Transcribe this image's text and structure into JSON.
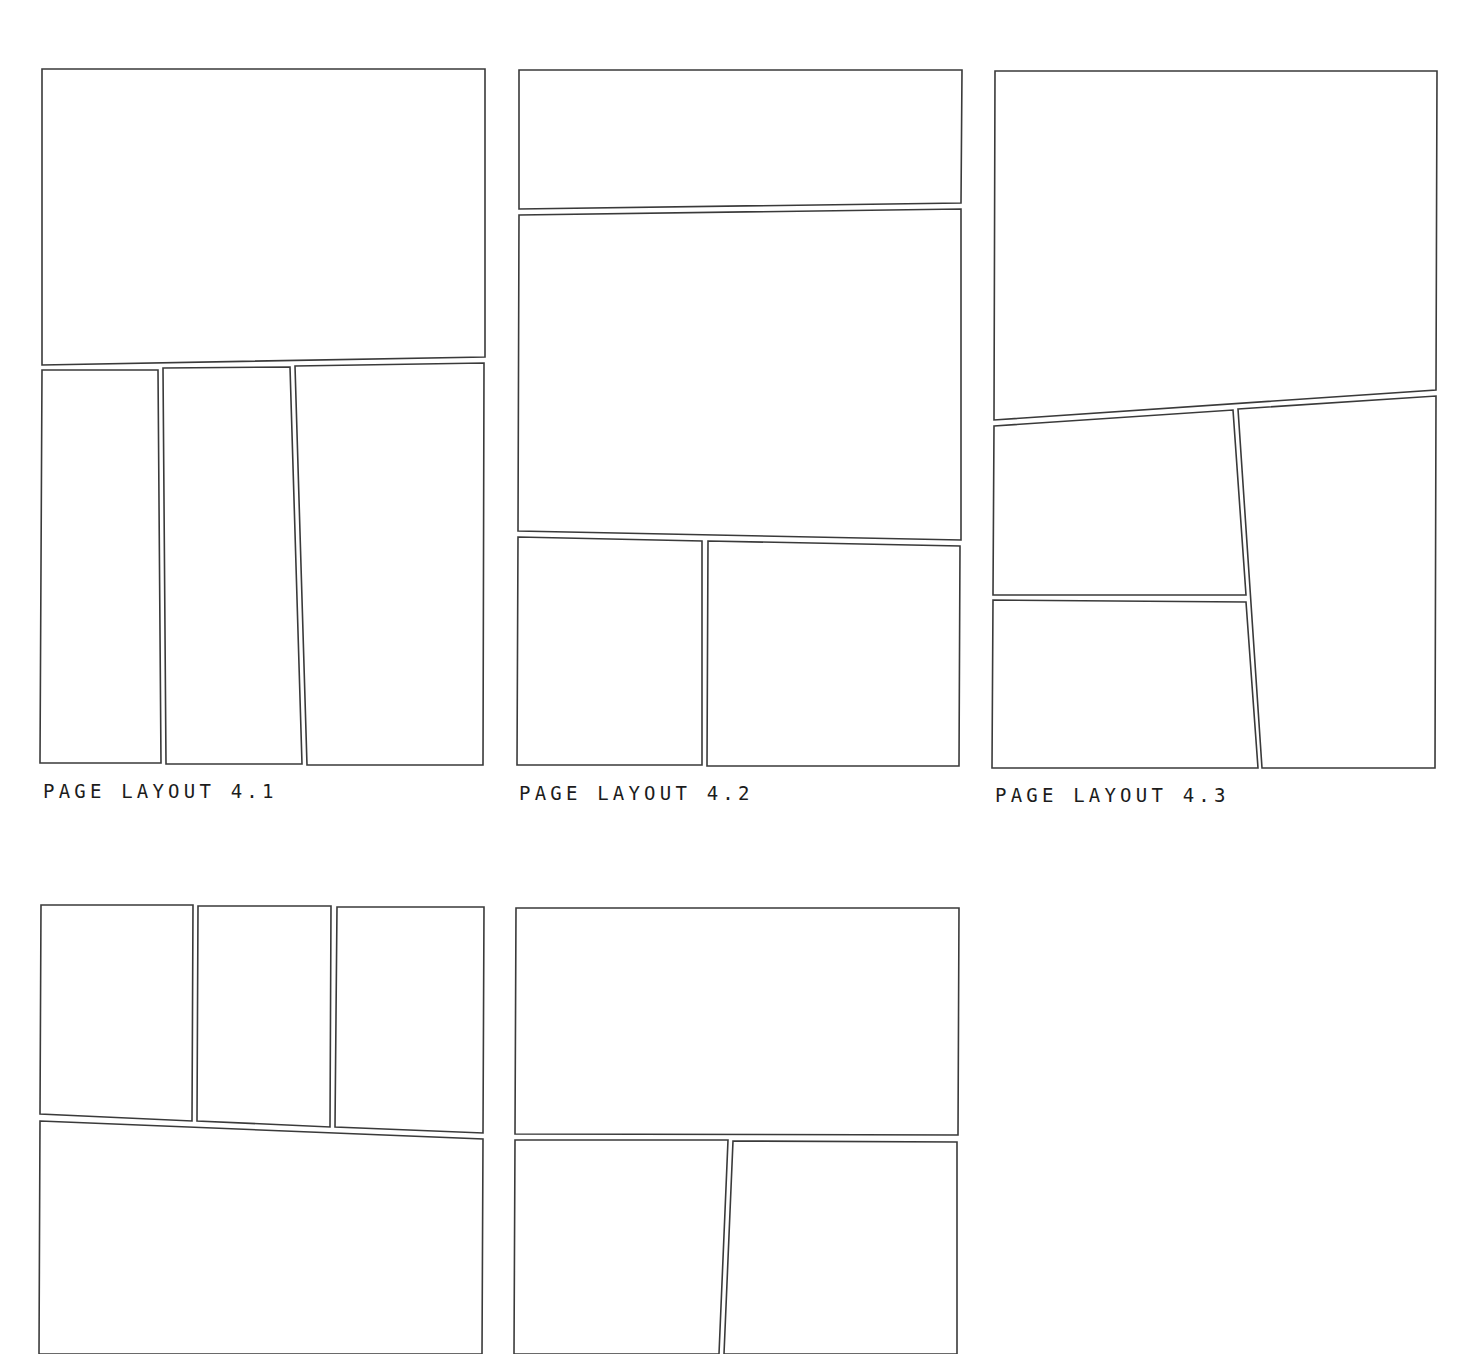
{
  "layouts": [
    {
      "id": "4.1",
      "caption": "PAGE LAYOUT 4.1",
      "caption_pos": [
        43,
        780
      ],
      "panels": [
        [
          [
            42,
            69
          ],
          [
            485,
            69
          ],
          [
            485,
            357
          ],
          [
            42,
            365
          ]
        ],
        [
          [
            42,
            370
          ],
          [
            158,
            370
          ],
          [
            161,
            763
          ],
          [
            40,
            763
          ]
        ],
        [
          [
            163,
            368
          ],
          [
            290,
            367
          ],
          [
            302,
            764
          ],
          [
            166,
            764
          ]
        ],
        [
          [
            295,
            366
          ],
          [
            484,
            363
          ],
          [
            483,
            765
          ],
          [
            307,
            765
          ]
        ]
      ]
    },
    {
      "id": "4.2",
      "caption": "PAGE LAYOUT 4.2",
      "caption_pos": [
        519,
        782
      ],
      "panels": [
        [
          [
            519,
            70
          ],
          [
            962,
            70
          ],
          [
            961,
            203
          ],
          [
            519,
            209
          ]
        ],
        [
          [
            519,
            215
          ],
          [
            961,
            209
          ],
          [
            961,
            540
          ],
          [
            518,
            531
          ]
        ],
        [
          [
            518,
            537
          ],
          [
            702,
            541
          ],
          [
            702,
            765
          ],
          [
            517,
            765
          ]
        ],
        [
          [
            708,
            541
          ],
          [
            960,
            546
          ],
          [
            959,
            766
          ],
          [
            707,
            766
          ]
        ]
      ]
    },
    {
      "id": "4.3",
      "caption": "PAGE LAYOUT 4.3",
      "caption_pos": [
        995,
        784
      ],
      "panels": [
        [
          [
            995,
            71
          ],
          [
            1437,
            71
          ],
          [
            1436,
            390
          ],
          [
            994,
            420
          ]
        ],
        [
          [
            994,
            426
          ],
          [
            1233,
            410
          ],
          [
            1246,
            595
          ],
          [
            993,
            595
          ]
        ],
        [
          [
            1238,
            409
          ],
          [
            1436,
            396
          ],
          [
            1435,
            768
          ],
          [
            1262,
            768
          ]
        ],
        [
          [
            993,
            600
          ],
          [
            1246,
            602
          ],
          [
            1258,
            768
          ],
          [
            992,
            768
          ]
        ]
      ]
    },
    {
      "id": "4.4",
      "caption": "",
      "panels": [
        [
          [
            41,
            905
          ],
          [
            193,
            905
          ],
          [
            192,
            1121
          ],
          [
            40,
            1114
          ]
        ],
        [
          [
            198,
            906
          ],
          [
            331,
            906
          ],
          [
            330,
            1127
          ],
          [
            197,
            1121
          ]
        ],
        [
          [
            337,
            907
          ],
          [
            484,
            907
          ],
          [
            483,
            1133
          ],
          [
            335,
            1127
          ]
        ],
        [
          [
            40,
            1121
          ],
          [
            483,
            1139
          ],
          [
            482,
            1354
          ],
          [
            39,
            1354
          ]
        ]
      ]
    },
    {
      "id": "4.5",
      "caption": "",
      "panels": [
        [
          [
            516,
            908
          ],
          [
            959,
            908
          ],
          [
            958,
            1135
          ],
          [
            515,
            1134
          ]
        ],
        [
          [
            515,
            1140
          ],
          [
            728,
            1140
          ],
          [
            719,
            1354
          ],
          [
            514,
            1354
          ]
        ],
        [
          [
            733,
            1141
          ],
          [
            957,
            1142
          ],
          [
            957,
            1354
          ],
          [
            724,
            1354
          ]
        ]
      ]
    }
  ]
}
